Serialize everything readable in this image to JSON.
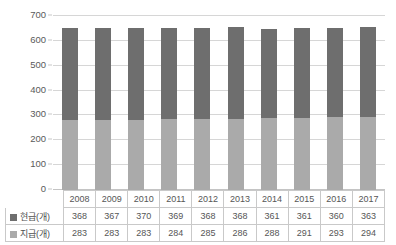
{
  "chart_data": {
    "type": "bar",
    "subtype": "stacked-column",
    "title": "",
    "xlabel": "",
    "ylabel": "",
    "ylim": [
      0,
      700
    ],
    "ytick_step": 100,
    "yticks": [
      "700",
      "600",
      "500",
      "400",
      "300",
      "200",
      "100",
      "0"
    ],
    "grid": true,
    "legend_position": "data-table-row-labels",
    "categories": [
      "2008",
      "2009",
      "2010",
      "2011",
      "2012",
      "2013",
      "2014",
      "2015",
      "2016",
      "2017"
    ],
    "series": [
      {
        "name": "현급(개)",
        "color": "#6e6e6e",
        "stack_position": "top",
        "values": [
          368,
          367,
          370,
          369,
          368,
          368,
          361,
          361,
          360,
          363
        ]
      },
      {
        "name": "지급(개)",
        "color": "#aaaaaa",
        "stack_position": "bottom",
        "values": [
          283,
          283,
          283,
          284,
          285,
          286,
          288,
          291,
          293,
          294
        ]
      }
    ],
    "totals": [
      651,
      650,
      653,
      653,
      653,
      654,
      649,
      652,
      653,
      657
    ]
  },
  "colors": {
    "series_dark": "#6e6e6e",
    "series_light": "#aaaaaa",
    "gridline": "#d6d6d6",
    "table_border": "#c9c9c9",
    "text": "#565656"
  }
}
